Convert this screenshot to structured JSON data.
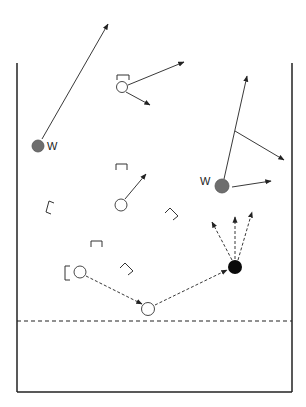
{
  "diagram": {
    "type": "play-diagram",
    "colors": {
      "line": "#222222",
      "gray_player": "#6e6e6e",
      "black_player": "#0a0a0a",
      "open_player_fill": "#ffffff"
    },
    "boundary": {
      "left_x": 17,
      "right_x": 292,
      "top_y": 63,
      "bottom_y": 392,
      "dashed_line_y": 321
    },
    "labels": {
      "w_left": "W",
      "w_right": "W"
    },
    "players": [
      {
        "id": "w-left",
        "type": "gray",
        "x": 38,
        "y": 146,
        "r": 6,
        "label": "W"
      },
      {
        "id": "w-right",
        "type": "gray",
        "x": 222,
        "y": 186,
        "r": 7,
        "label": "W"
      },
      {
        "id": "open-top",
        "type": "open",
        "x": 122,
        "y": 87,
        "r": 5
      },
      {
        "id": "open-middle",
        "type": "open",
        "x": 121,
        "y": 205,
        "r": 6
      },
      {
        "id": "open-lower-left",
        "type": "open",
        "x": 80,
        "y": 272,
        "r": 6
      },
      {
        "id": "open-bottom",
        "type": "open",
        "x": 148,
        "y": 309,
        "r": 6
      },
      {
        "id": "black-target",
        "type": "black",
        "x": 235,
        "y": 267,
        "r": 7
      }
    ],
    "brackets_count": 7,
    "arrows": {
      "solid_count": 7,
      "dashed_count": 5
    }
  }
}
